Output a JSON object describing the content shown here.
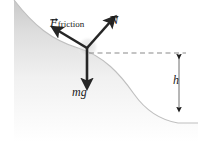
{
  "figure": {
    "background_color": "#ffffff",
    "surface_color": "#d6d6d6",
    "surface_line_color": "#bdbdbd",
    "arrow_color": "#262626",
    "dashed_line_color": "#8a8a8a",
    "labels": {
      "friction": {
        "symbol": "F",
        "subscript": "friction",
        "vector": true
      },
      "normal": {
        "symbol": "N",
        "subscript": "",
        "vector": true
      },
      "weight": {
        "symbol": "mg",
        "subscript": "",
        "vector": false
      },
      "height": {
        "symbol": "h",
        "subscript": "",
        "vector": false
      }
    },
    "vectors": [
      {
        "name": "friction",
        "from": [
          87,
          48
        ],
        "to": [
          55,
          29
        ],
        "label": "F_friction"
      },
      {
        "name": "normal",
        "from": [
          87,
          48
        ],
        "to": [
          113,
          19
        ],
        "label": "N"
      },
      {
        "name": "weight",
        "from": [
          87,
          48
        ],
        "to": [
          87,
          86
        ],
        "label": "mg"
      }
    ],
    "dimension": {
      "name": "height",
      "label": "h",
      "from": [
        179,
        53
      ],
      "to": [
        179,
        112
      ]
    },
    "reference_line": {
      "name": "horizontal-dashed",
      "from": [
        89,
        53
      ],
      "to": [
        186,
        53
      ]
    }
  }
}
